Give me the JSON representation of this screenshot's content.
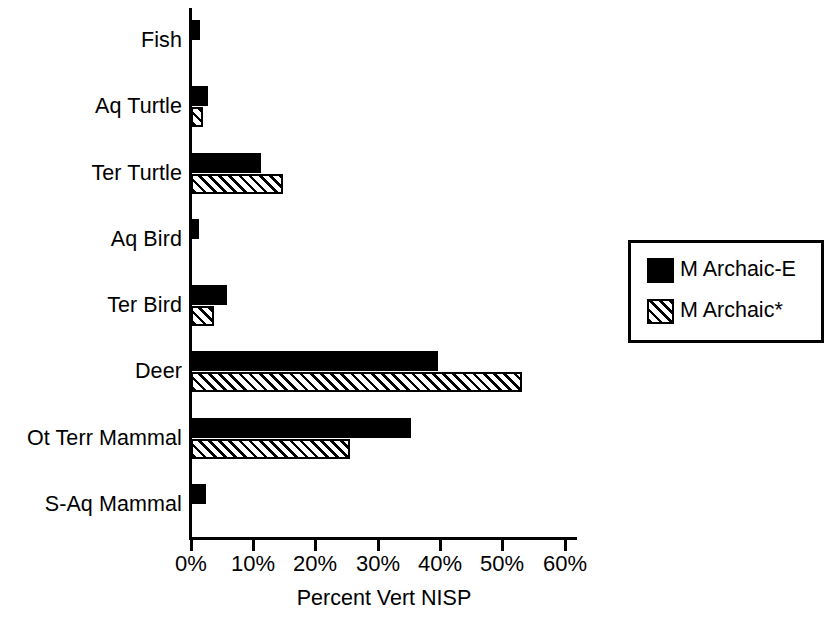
{
  "chart_data": {
    "type": "bar",
    "orientation": "horizontal",
    "title": "",
    "xlabel": "Percent Vert NISP",
    "ylabel": "",
    "xlim": [
      0,
      60
    ],
    "xtick_labels": [
      "0%",
      "10%",
      "20%",
      "30%",
      "40%",
      "50%",
      "60%"
    ],
    "xticks": [
      0,
      10,
      20,
      30,
      40,
      50,
      60
    ],
    "grid": false,
    "legend_position": "right",
    "categories": [
      "Fish",
      "Aq Turtle",
      "Ter Turtle",
      "Aq Bird",
      "Ter Bird",
      "Deer",
      "Ot Terr Mammal",
      "S-Aq Mammal"
    ],
    "series": [
      {
        "name": "M Archaic-E",
        "fill": "solid-black",
        "values": [
          1.5,
          2.7,
          11.2,
          1.3,
          5.7,
          39.7,
          35.3,
          2.4
        ]
      },
      {
        "name": "M Archaic*",
        "fill": "diagonal-hatch",
        "values": [
          0,
          1.9,
          14.8,
          0,
          3.7,
          53.2,
          25.5,
          0
        ]
      }
    ]
  },
  "axis": {
    "x_title": "Percent Vert NISP",
    "ticks": [
      "0%",
      "10%",
      "20%",
      "30%",
      "40%",
      "50%",
      "60%"
    ]
  },
  "categories": [
    {
      "label": "Fish"
    },
    {
      "label": "Aq Turtle"
    },
    {
      "label": "Ter Turtle"
    },
    {
      "label": "Aq Bird"
    },
    {
      "label": "Ter Bird"
    },
    {
      "label": "Deer"
    },
    {
      "label": "Ot Terr Mammal"
    },
    {
      "label": "S-Aq Mammal"
    }
  ],
  "legend": {
    "items": [
      {
        "label": "M Archaic-E",
        "swatch": "solid-black"
      },
      {
        "label": "M Archaic*",
        "swatch": "diagonal-hatch"
      }
    ]
  },
  "colors": {
    "series_1": "#000000",
    "series_2_lines": "#000000",
    "series_2_background": "#ffffff",
    "axis": "#000000",
    "background": "#ffffff"
  }
}
